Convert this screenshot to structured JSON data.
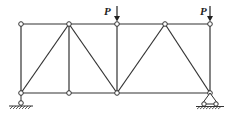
{
  "diagram": {
    "type": "truss",
    "nodes": {
      "top": [
        [
          21,
          24
        ],
        [
          69,
          24
        ],
        [
          117,
          24
        ],
        [
          165,
          24
        ],
        [
          210,
          24
        ]
      ],
      "bottom": [
        [
          21,
          93
        ],
        [
          69,
          93
        ],
        [
          117,
          93
        ],
        [
          210,
          93
        ]
      ]
    },
    "loads": [
      {
        "label": "P",
        "node": "top-3",
        "x": 117
      },
      {
        "label": "P",
        "node": "top-5",
        "x": 210
      }
    ],
    "supports": [
      {
        "type": "pin-roller",
        "x": 21,
        "label": ""
      },
      {
        "type": "pin",
        "x": 210,
        "label": ""
      }
    ],
    "colors": {
      "line": "#333333",
      "node_fill": "#ffffff"
    }
  },
  "labels": {
    "load_left": "P",
    "load_right": "P"
  }
}
